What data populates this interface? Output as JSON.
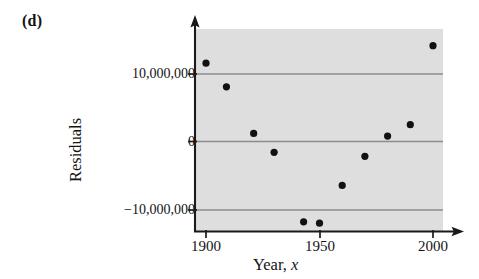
{
  "figure": {
    "part_label": "(d)"
  },
  "chart_data": {
    "type": "scatter",
    "title": "",
    "xlabel": "Year, x",
    "ylabel": "Residuals",
    "xlim": [
      1897,
      2003
    ],
    "ylim": [
      -14500000,
      16000000
    ],
    "grid": true,
    "gridlines_y": [
      10000000,
      0,
      -10000000
    ],
    "legend": "none",
    "x_ticks": [
      1900,
      1950,
      2000
    ],
    "x_tick_labels": [
      "1900",
      "1950",
      "2000"
    ],
    "y_ticks": [
      10000000,
      0,
      -10000000
    ],
    "y_tick_labels": [
      "10,000,000",
      "0",
      "−10,000,000"
    ],
    "plot_background": "#dedede",
    "point_color": "#111111",
    "x": [
      1900,
      1909,
      1921,
      1930,
      1943,
      1950,
      1960,
      1970,
      1980,
      1990,
      2000
    ],
    "y": [
      11600000,
      8100000,
      1200000,
      -1600000,
      -11900000,
      -12100000,
      -6500000,
      -2200000,
      800000,
      2500000,
      14200000
    ],
    "points": [
      {
        "x": 1900,
        "y": 11600000
      },
      {
        "x": 1909,
        "y": 8100000
      },
      {
        "x": 1921,
        "y": 1200000
      },
      {
        "x": 1930,
        "y": -1600000
      },
      {
        "x": 1943,
        "y": -11900000
      },
      {
        "x": 1950,
        "y": -12100000
      },
      {
        "x": 1960,
        "y": -6500000
      },
      {
        "x": 1970,
        "y": -2200000
      },
      {
        "x": 1980,
        "y": 800000
      },
      {
        "x": 1990,
        "y": 2500000
      },
      {
        "x": 2000,
        "y": 14200000
      }
    ]
  },
  "axis_labels": {
    "y_top": "10,000,000",
    "y_mid": "0",
    "y_bottom": "−10,000,000",
    "x_left": "1900",
    "x_mid": "1950",
    "x_right": "2000",
    "x_title_word": "Year,",
    "x_title_var": "x",
    "y_title": "Residuals"
  },
  "colors": {
    "page_background": "#ffffff",
    "plot_background": "#dedede",
    "axis": "#1a1a1a",
    "gridline": "#8a8a8a",
    "marker": "#111111",
    "text": "#141414"
  }
}
